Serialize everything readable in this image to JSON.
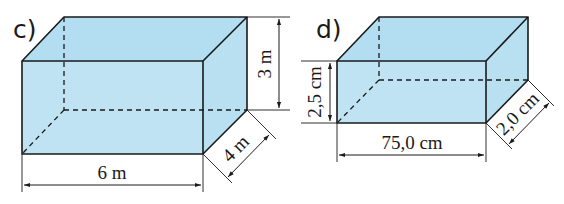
{
  "figures": [
    {
      "id": "c",
      "label": "c)",
      "length": "6 m",
      "height": "3 m",
      "depth": "4 m"
    },
    {
      "id": "d",
      "label": "d)",
      "length": "75,0 cm",
      "height": "2,5 cm",
      "depth": "2,0 cm"
    }
  ],
  "colors": {
    "box_fill": "#bfe3f3",
    "edge": "#1a1a1a",
    "background": "#ffffff"
  }
}
